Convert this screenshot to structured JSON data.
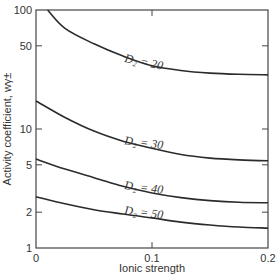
{
  "chart_data": {
    "type": "line",
    "title": "",
    "xlabel": "Ionic strength",
    "ylabel": "Activity coefficient, wγ±",
    "xlim": [
      0,
      0.2
    ],
    "ylim": [
      1,
      100
    ],
    "yscale": "log",
    "grid": false,
    "legend": "inline curve labels",
    "x_ticks": [
      "0",
      "0.1",
      "0.2"
    ],
    "y_ticks": [
      "1",
      "2",
      "5",
      "10",
      "50",
      "100"
    ],
    "x": [
      0,
      0.025,
      0.05,
      0.075,
      0.1,
      0.125,
      0.15,
      0.175,
      0.2
    ],
    "series": [
      {
        "name": "D2 = 20",
        "label": "D₂ = 20",
        "values": [
          100,
          70,
          52,
          41,
          34,
          31,
          29.5,
          28.8,
          28.5
        ]
      },
      {
        "name": "D2 = 30",
        "label": "D₂ = 30",
        "values": [
          17.2,
          12.5,
          9.6,
          7.9,
          6.9,
          6.1,
          5.7,
          5.5,
          5.4
        ]
      },
      {
        "name": "D2 = 40",
        "label": "D₂ = 40",
        "values": [
          5.6,
          4.6,
          3.9,
          3.3,
          2.9,
          2.65,
          2.5,
          2.42,
          2.4
        ]
      },
      {
        "name": "D2 = 50",
        "label": "D₂ = 50",
        "values": [
          2.7,
          2.35,
          2.1,
          1.93,
          1.79,
          1.65,
          1.56,
          1.5,
          1.47
        ]
      }
    ]
  }
}
